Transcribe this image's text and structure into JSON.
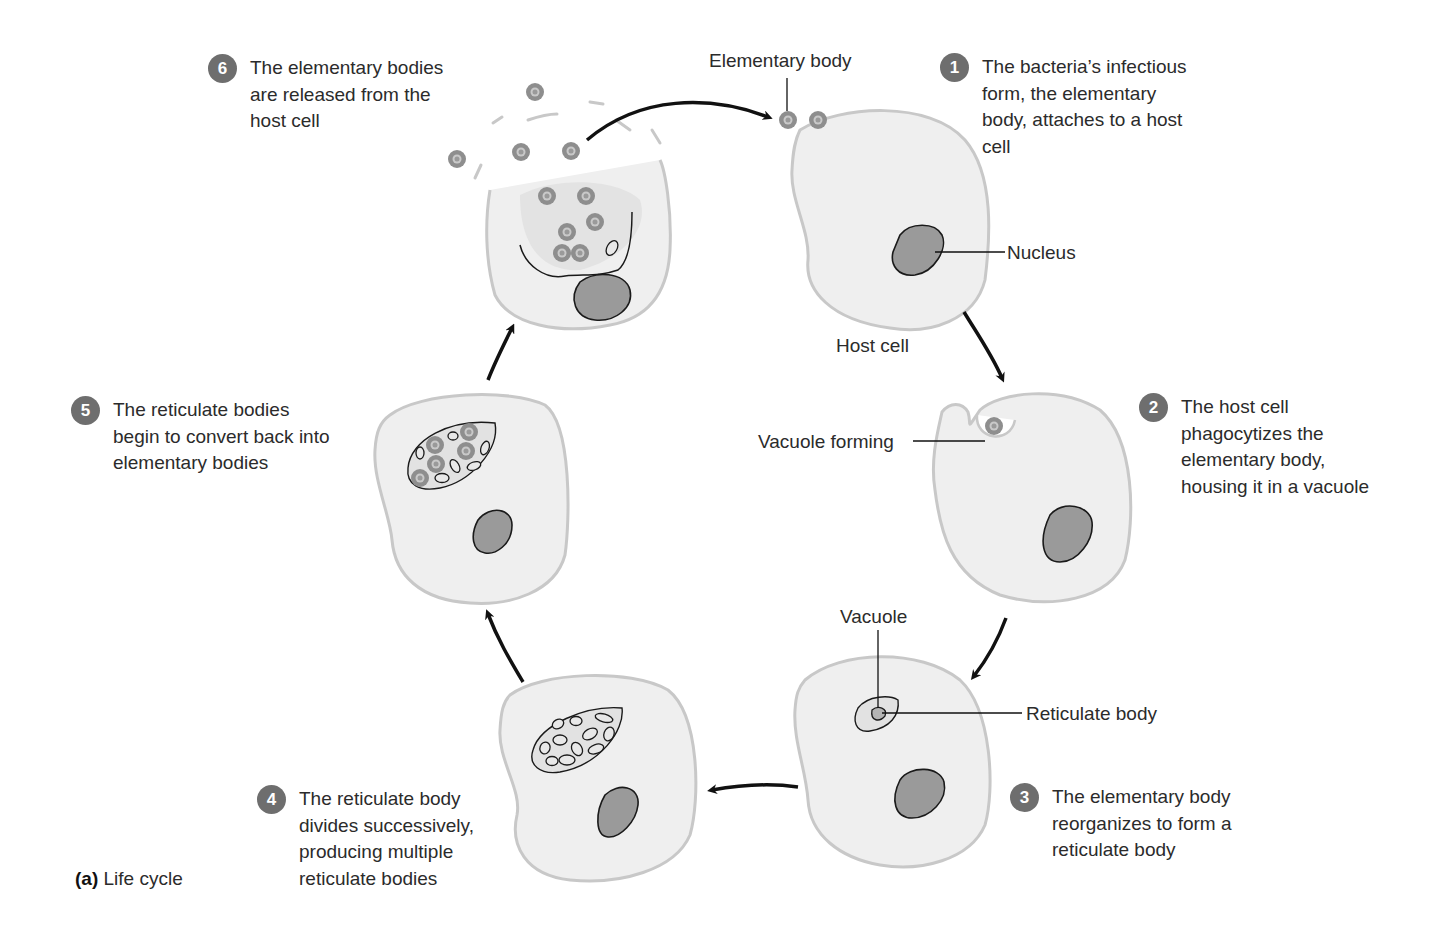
{
  "figure": {
    "caption_tag": "(a)",
    "caption_text": "Life cycle",
    "colors": {
      "cell_fill": "#efefef",
      "cell_outline": "#c8c8c8",
      "nucleus_fill": "#9a9a9a",
      "nucleus_outline": "#1a1a1a",
      "elementary_body": "#8e8e8e",
      "badge": "#6e6e6e",
      "arrow": "#111111"
    }
  },
  "labels": {
    "elementary_body": "Elementary body",
    "nucleus": "Nucleus",
    "host_cell": "Host cell",
    "vacuole_forming": "Vacuole forming",
    "vacuole": "Vacuole",
    "reticulate_body": "Reticulate body"
  },
  "steps": [
    {
      "number": "1",
      "lines": [
        "The bacteria’s infectious",
        "form, the elementary",
        "body, attaches to a host",
        "cell"
      ]
    },
    {
      "number": "2",
      "lines": [
        "The host cell",
        "phagocytizes the",
        "elementary body,",
        "housing it in a vacuole"
      ]
    },
    {
      "number": "3",
      "lines": [
        "The elementary body",
        "reorganizes to form a",
        "reticulate body"
      ]
    },
    {
      "number": "4",
      "lines": [
        "The reticulate body",
        "divides successively,",
        "producing multiple",
        "reticulate bodies"
      ]
    },
    {
      "number": "5",
      "lines": [
        "The reticulate bodies",
        "begin to convert back into",
        "elementary bodies"
      ]
    },
    {
      "number": "6",
      "lines": [
        "The elementary bodies",
        "are released from the",
        "host cell"
      ]
    }
  ]
}
